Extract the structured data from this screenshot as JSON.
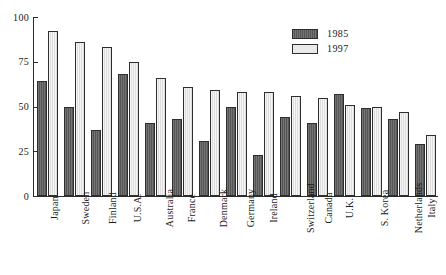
{
  "chart_data": {
    "type": "bar",
    "title": "",
    "subtitle": "",
    "xlabel": "",
    "ylabel": "",
    "ylim": [
      0,
      100
    ],
    "yticks": [
      0,
      25,
      50,
      75,
      100
    ],
    "grid": false,
    "legend_position": "top-right",
    "categories": [
      "Japan",
      "Sweden",
      "Finland",
      "U.S.A.",
      "Australia",
      "France",
      "Denmark",
      "Germany",
      "Ireland",
      "Switzerland",
      "Canada",
      "U.K.",
      "S. Korea",
      "Netherlands",
      "Italy"
    ],
    "series": [
      {
        "name": "1985",
        "color": "#5f5f5f",
        "values": [
          64,
          50,
          37,
          68,
          41,
          43,
          31,
          50,
          23,
          44,
          41,
          57,
          49,
          43,
          29
        ]
      },
      {
        "name": "1997",
        "color": "#e9e9e9",
        "values": [
          92,
          86,
          83,
          75,
          66,
          61,
          59,
          58,
          58,
          56,
          55,
          51,
          50,
          47,
          34
        ]
      }
    ]
  },
  "legend": {
    "entries": [
      {
        "label": "1985"
      },
      {
        "label": "1997"
      }
    ]
  },
  "axis": {
    "y_tick_labels": [
      "0",
      "25",
      "50",
      "75",
      "100"
    ]
  }
}
